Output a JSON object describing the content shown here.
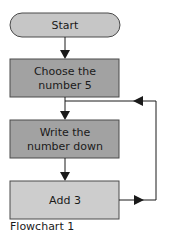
{
  "diagram": {
    "colors": {
      "terminal_fill": "#c6c6c6",
      "process_dark_fill": "#a2a2a2",
      "process_light_fill": "#cdcdcd",
      "stroke": "#4a4a4a",
      "line": "#1a1a1a"
    },
    "nodes": [
      {
        "id": "start",
        "type": "terminal",
        "lines": [
          "Start"
        ]
      },
      {
        "id": "choose",
        "type": "process",
        "lines": [
          "Choose the",
          "number 5"
        ]
      },
      {
        "id": "write",
        "type": "process",
        "lines": [
          "Write the",
          "number down"
        ]
      },
      {
        "id": "add",
        "type": "process",
        "lines": [
          "Add 3"
        ]
      }
    ],
    "edges": [
      {
        "from": "start",
        "to": "choose"
      },
      {
        "from": "choose",
        "to": "write"
      },
      {
        "from": "write",
        "to": "add"
      },
      {
        "from": "add",
        "to": "write",
        "label": "loop back"
      }
    ],
    "caption": "Flowchart 1"
  }
}
